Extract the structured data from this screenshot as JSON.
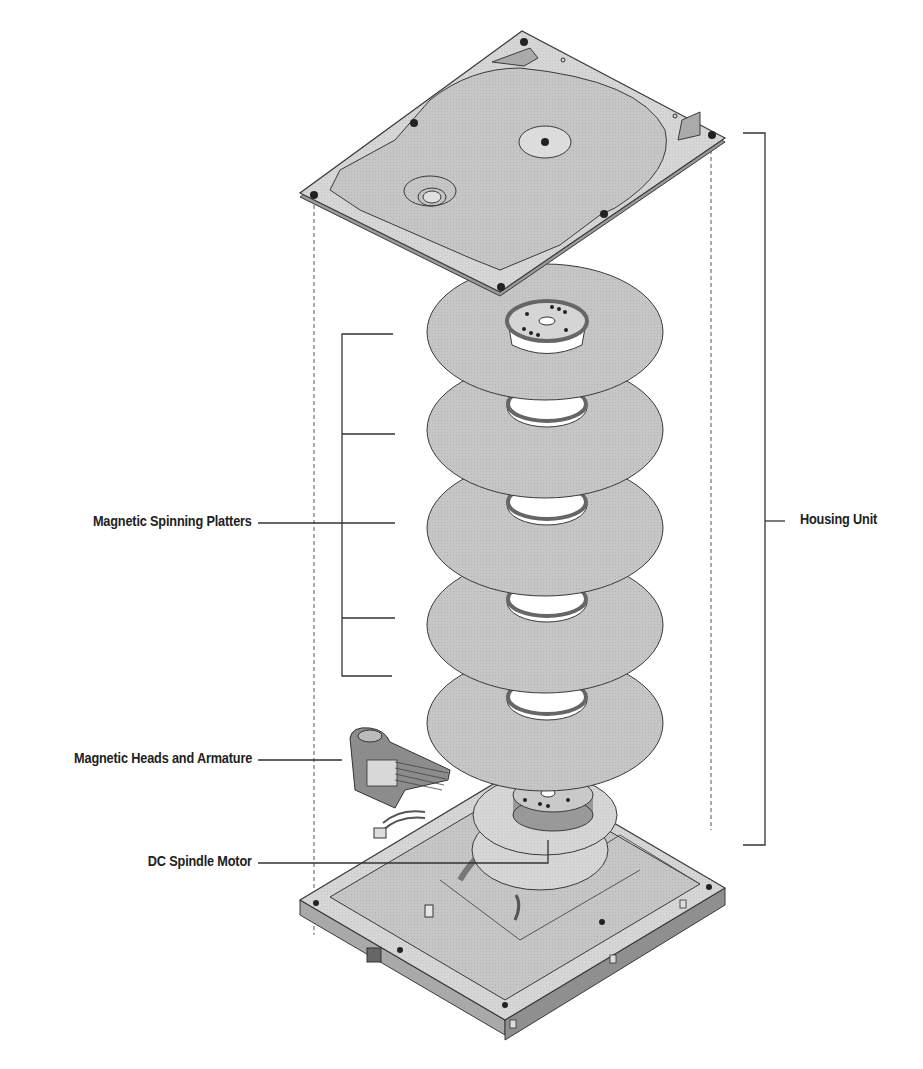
{
  "labels": {
    "platters": "Magnetic Spinning Platters",
    "heads": "Magnetic Heads and Armature",
    "motor": "DC Spindle Motor",
    "housing": "Housing Unit"
  },
  "components": [
    {
      "id": "top-cover",
      "name": "Top cover"
    },
    {
      "id": "platter",
      "name": "Platter",
      "count": 5
    },
    {
      "id": "head-armature",
      "name": "Magnetic heads and armature"
    },
    {
      "id": "spindle-motor",
      "name": "DC spindle motor"
    },
    {
      "id": "base-housing",
      "name": "Base housing"
    }
  ],
  "colors": {
    "background": "#ffffff",
    "part_fill": "#c4c4c4",
    "part_light": "#dcdcdc",
    "part_dark": "#8a8a8a",
    "outline": "#3a3a3a",
    "leader_line": "#333333",
    "text": "#222222"
  }
}
